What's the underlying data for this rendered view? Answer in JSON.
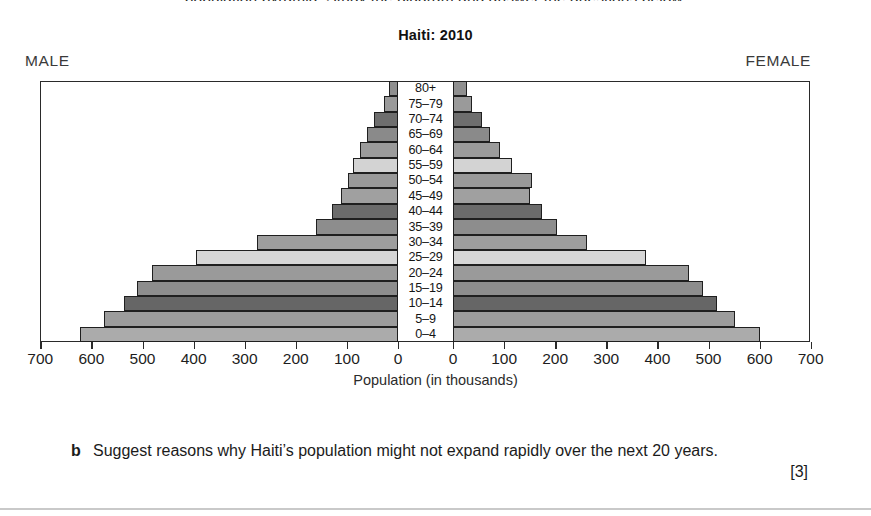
{
  "page": {
    "clipped_top_line": "population pyramid. Study the diagram and answer the questions below.",
    "rule_color": "#c9c9c9"
  },
  "figure": {
    "title": "Haiti: 2010",
    "male_label": "MALE",
    "female_label": "FEMALE",
    "axis_caption": "Population (in thousands)",
    "tick_labels_left": [
      "700",
      "600",
      "500",
      "400",
      "300",
      "200",
      "100",
      "0"
    ],
    "tick_labels_right": [
      "0",
      "100",
      "200",
      "300",
      "400",
      "500",
      "600",
      "700"
    ]
  },
  "question": {
    "letter": "b",
    "text": "Suggest reasons why Haiti’s population might not expand rapidly over the next 20 years.",
    "marks": "[3]"
  },
  "chart_data": {
    "type": "bar",
    "subtype": "population-pyramid",
    "title": "Haiti: 2010",
    "xlabel": "Population (in thousands)",
    "ylabel": "",
    "xlim": [
      -700,
      700
    ],
    "xticks": [
      700,
      600,
      500,
      400,
      300,
      200,
      100,
      0,
      0,
      100,
      200,
      300,
      400,
      500,
      600,
      700
    ],
    "grid": false,
    "legend": "none",
    "categories": [
      "80+",
      "75–79",
      "70–74",
      "65–69",
      "60–64",
      "55–59",
      "50–54",
      "45–49",
      "40–44",
      "35–39",
      "30–34",
      "25–29",
      "20–24",
      "15–19",
      "10–14",
      "5–9",
      "0–4"
    ],
    "series": [
      {
        "name": "MALE",
        "side": "left",
        "values": [
          18,
          27,
          47,
          61,
          75,
          88,
          98,
          112,
          129,
          160,
          275,
          395,
          482,
          510,
          537,
          575,
          622
        ]
      },
      {
        "name": "FEMALE",
        "side": "right",
        "values": [
          27,
          37,
          57,
          73,
          92,
          116,
          155,
          151,
          175,
          204,
          263,
          378,
          461,
          490,
          516,
          551,
          600
        ]
      }
    ],
    "bar_shades": [
      "#8f8f8f",
      "#9a9a9a",
      "#6e6e6e",
      "#8a8a8a",
      "#9b9b9b",
      "#d3d3d3",
      "#999999",
      "#a0a0a0",
      "#6b6b6b",
      "#8d8d8d",
      "#9e9e9e",
      "#d6d6d6",
      "#9a9a9a",
      "#8d8d8d",
      "#666666",
      "#9c9c9c",
      "#ababab"
    ]
  }
}
